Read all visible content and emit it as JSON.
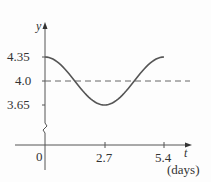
{
  "chart_data": {
    "type": "line",
    "title": "",
    "xlabel": "t",
    "xlabel_unit": "(days)",
    "ylabel": "y",
    "x_ticks": [
      "0",
      "2.7",
      "5.4"
    ],
    "y_ticks": [
      "3.65",
      "4.0",
      "4.35"
    ],
    "series": [
      {
        "name": "y(t) = 4.0 + 0.35 cos(2πt/5.4)",
        "x": [
          0,
          0.675,
          1.35,
          2.025,
          2.7,
          3.375,
          4.05,
          4.725,
          5.4
        ],
        "values": [
          4.35,
          4.247,
          4.0,
          3.753,
          3.65,
          3.753,
          4.0,
          4.247,
          4.35
        ]
      }
    ],
    "reference_lines": [
      {
        "axis": "y",
        "value": 4.0,
        "style": "dashed"
      }
    ],
    "xlim": [
      0,
      5.4
    ],
    "ylim": [
      3.65,
      4.35
    ],
    "y_axis_break": true,
    "grid": false,
    "legend": "none"
  },
  "labels": {
    "y_axis": "y",
    "t_axis": "t",
    "unit": "(days)",
    "y_top": "4.35",
    "y_mid": "4.0",
    "y_low": "3.65",
    "x_zero": "0",
    "x_mid": "2.7",
    "x_end": "5.4"
  }
}
